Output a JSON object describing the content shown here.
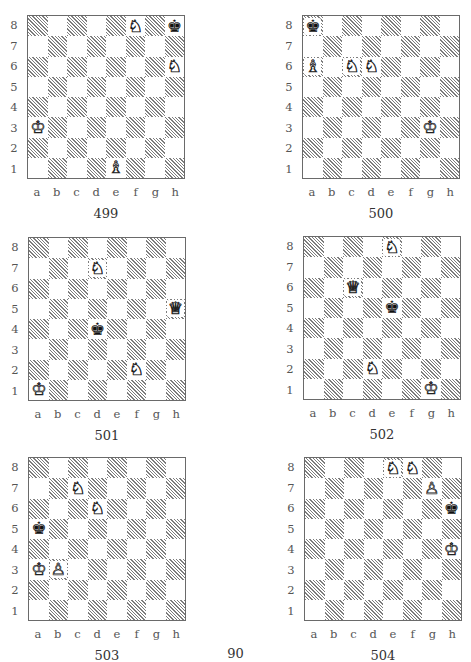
{
  "page": {
    "number": "90"
  },
  "files": [
    "a",
    "b",
    "c",
    "d",
    "e",
    "f",
    "g",
    "h"
  ],
  "ranks": [
    "8",
    "7",
    "6",
    "5",
    "4",
    "3",
    "2",
    "1"
  ],
  "glyphs": {
    "wK": "♔",
    "wQ": "♕",
    "wR": "♖",
    "wB": "♗",
    "wN": "♘",
    "wP": "♙",
    "bK": "♚",
    "bQ": "♛",
    "bR": "♜",
    "bB": "♝",
    "bN": "♞",
    "bP": "♟"
  },
  "diagrams": [
    {
      "id": "499",
      "caption": "499",
      "left": 27,
      "top": 15,
      "pieces": [
        {
          "square": "f8",
          "piece": "wN",
          "name": "white-knight"
        },
        {
          "square": "h8",
          "piece": "bK",
          "name": "black-king"
        },
        {
          "square": "h6",
          "piece": "wN",
          "name": "white-knight"
        },
        {
          "square": "a3",
          "piece": "wK",
          "name": "white-king"
        },
        {
          "square": "e1",
          "piece": "wB",
          "name": "white-bishop"
        }
      ]
    },
    {
      "id": "500",
      "caption": "500",
      "left": 302,
      "top": 15,
      "pieces": [
        {
          "square": "a8",
          "piece": "bK",
          "name": "black-king"
        },
        {
          "square": "a6",
          "piece": "wB",
          "name": "white-bishop"
        },
        {
          "square": "c6",
          "piece": "wN",
          "name": "white-knight"
        },
        {
          "square": "d6",
          "piece": "wN",
          "name": "white-knight"
        },
        {
          "square": "g3",
          "piece": "wK",
          "name": "white-king"
        }
      ]
    },
    {
      "id": "501",
      "caption": "501",
      "left": 28,
      "top": 237,
      "pieces": [
        {
          "square": "d7",
          "piece": "wN",
          "name": "white-knight"
        },
        {
          "square": "h5",
          "piece": "wQ",
          "name": "white-queen"
        },
        {
          "square": "d4",
          "piece": "bK",
          "name": "black-king"
        },
        {
          "square": "f2",
          "piece": "wN",
          "name": "white-knight"
        },
        {
          "square": "a1",
          "piece": "wK",
          "name": "white-king"
        }
      ]
    },
    {
      "id": "502",
      "caption": "502",
      "left": 303,
      "top": 236,
      "pieces": [
        {
          "square": "e8",
          "piece": "wN",
          "name": "white-knight"
        },
        {
          "square": "c6",
          "piece": "wQ",
          "name": "white-queen"
        },
        {
          "square": "e5",
          "piece": "bK",
          "name": "black-king"
        },
        {
          "square": "d2",
          "piece": "wN",
          "name": "white-knight"
        },
        {
          "square": "g1",
          "piece": "wK",
          "name": "white-king"
        }
      ]
    },
    {
      "id": "503",
      "caption": "503",
      "left": 28,
      "top": 457,
      "pieces": [
        {
          "square": "c7",
          "piece": "wN",
          "name": "white-knight"
        },
        {
          "square": "d6",
          "piece": "wN",
          "name": "white-knight"
        },
        {
          "square": "a5",
          "piece": "bK",
          "name": "black-king"
        },
        {
          "square": "a3",
          "piece": "wK",
          "name": "white-king"
        },
        {
          "square": "b3",
          "piece": "wP",
          "name": "white-pawn"
        }
      ]
    },
    {
      "id": "504",
      "caption": "504",
      "left": 304,
      "top": 457,
      "pieces": [
        {
          "square": "e8",
          "piece": "wN",
          "name": "white-knight"
        },
        {
          "square": "f8",
          "piece": "wN",
          "name": "white-knight"
        },
        {
          "square": "g7",
          "piece": "wP",
          "name": "white-pawn"
        },
        {
          "square": "h6",
          "piece": "bK",
          "name": "black-king"
        },
        {
          "square": "h4",
          "piece": "wK",
          "name": "white-king"
        }
      ]
    }
  ]
}
